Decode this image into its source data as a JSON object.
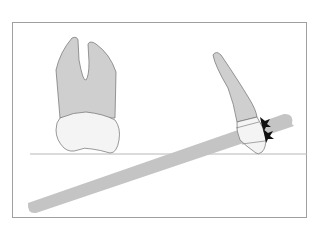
{
  "figure": {
    "colors": {
      "background": "#ffffff",
      "frame": "#a0a0a0",
      "root_fill": "#cfcfcf",
      "crown_fill": "#f4f4f4",
      "outline": "#6e6e6e",
      "bar_fill": "#c4c4c4",
      "occlusal_line": "#b8b8b8",
      "arrow_fill": "#111111"
    },
    "elements": {
      "frame": "frame-border",
      "molar": "molar-tooth",
      "tilted_tooth": "tilted-tooth",
      "bar": "film-bar",
      "plane": "occlusal-plane-line",
      "arrows": "contact-arrows"
    }
  }
}
